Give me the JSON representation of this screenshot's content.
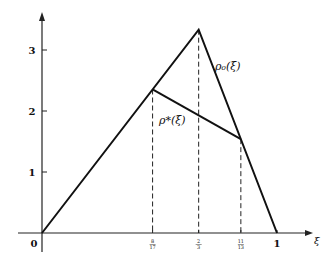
{
  "diagram": {
    "type": "piecewise-linear-plot",
    "x_axis": {
      "label": "ξ",
      "range": [
        0,
        1
      ],
      "ticks": [
        {
          "value": 0,
          "label": "0"
        },
        {
          "value": 0.470588,
          "label": "8/17",
          "num": "8",
          "den": "17"
        },
        {
          "value": 0.666667,
          "label": "2/3",
          "num": "2",
          "den": "3"
        },
        {
          "value": 0.846154,
          "label": "11/13",
          "num": "11",
          "den": "13"
        },
        {
          "value": 1,
          "label": "1"
        }
      ]
    },
    "y_axis": {
      "range": [
        0,
        3.6
      ],
      "ticks": [
        {
          "value": 1,
          "label": "1"
        },
        {
          "value": 2,
          "label": "2"
        },
        {
          "value": 3,
          "label": "3"
        }
      ]
    },
    "curves": [
      {
        "name": "rho0",
        "label": "ρ₀(ξ)",
        "points": [
          [
            0,
            0
          ],
          [
            0.666667,
            3.333333
          ],
          [
            1,
            0
          ]
        ]
      },
      {
        "name": "rho-star",
        "label": "ρ*(ξ)",
        "points": [
          [
            0.470588,
            2.352941
          ],
          [
            0.846154,
            1.538462
          ]
        ]
      }
    ],
    "guides": [
      {
        "x": 0.470588,
        "y": 2.352941
      },
      {
        "x": 0.666667,
        "y": 3.333333
      },
      {
        "x": 0.846154,
        "y": 1.538462
      }
    ]
  }
}
